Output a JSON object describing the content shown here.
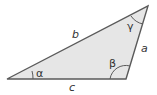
{
  "diagram": {
    "type": "triangle",
    "fill_color": "#e6e6e6",
    "stroke_color": "#5a5a5a",
    "vertices": {
      "A": [
        7,
        79
      ],
      "B": [
        126,
        79
      ],
      "C": [
        148,
        6
      ]
    },
    "sides": {
      "a": "a",
      "b": "b",
      "c": "c"
    },
    "angles": {
      "alpha": "α",
      "beta": "β",
      "gamma": "γ"
    }
  }
}
